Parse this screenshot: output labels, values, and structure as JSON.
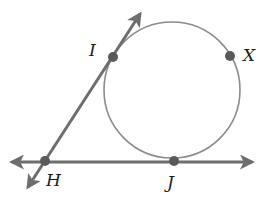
{
  "figure": {
    "colors": {
      "background": "#ffffff",
      "circle_stroke": "#8c8c8c",
      "line_stroke": "#6e6e6e",
      "point_fill": "#5a5a5a",
      "label_text": "#1a1a1a"
    },
    "circle": {
      "cx": 172,
      "cy": 90,
      "r": 68
    },
    "points": [
      {
        "id": "I",
        "label": "I",
        "x": 113,
        "y": 57
      },
      {
        "id": "X",
        "label": "X",
        "x": 230,
        "y": 56
      },
      {
        "id": "J",
        "label": "J",
        "x": 174,
        "y": 161
      },
      {
        "id": "H",
        "label": "H",
        "x": 45,
        "y": 161
      }
    ],
    "lines": [
      {
        "id": "line-HJ",
        "name": "tangent line HJ",
        "x1": 12,
        "y1": 162,
        "x2": 252,
        "y2": 162,
        "arrows": "both"
      },
      {
        "id": "line-HI",
        "name": "tangent line HI",
        "x1": 28,
        "y1": 187,
        "x2": 140,
        "y2": 14,
        "arrows": "both"
      }
    ]
  }
}
